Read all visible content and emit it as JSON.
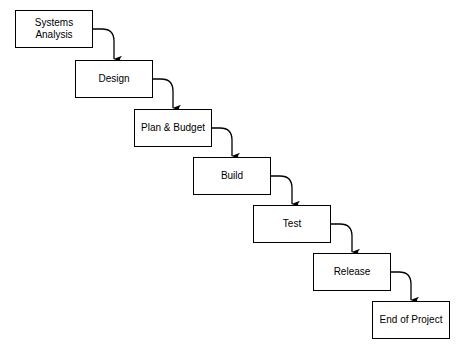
{
  "diagram": {
    "type": "flowchart",
    "background_color": "#ffffff",
    "line_color": "#000000",
    "box_fill_color": "#ffffff",
    "box_border_color": "#000000",
    "text_color": "#000000",
    "nodes": [
      {
        "id": "systems-analysis",
        "label": "Systems\nAnalysis",
        "x": 15,
        "y": 10,
        "width": 78,
        "height": 38
      },
      {
        "id": "design",
        "label": "Design",
        "x": 75,
        "y": 60,
        "width": 78,
        "height": 38
      },
      {
        "id": "plan-and-budget",
        "label": "Plan & Budget",
        "x": 134,
        "y": 109,
        "width": 78,
        "height": 38
      },
      {
        "id": "build",
        "label": "Build",
        "x": 193,
        "y": 157,
        "width": 78,
        "height": 38
      },
      {
        "id": "test",
        "label": "Test",
        "x": 253,
        "y": 205,
        "width": 78,
        "height": 38
      },
      {
        "id": "release",
        "label": "Release",
        "x": 313,
        "y": 253,
        "width": 78,
        "height": 38
      },
      {
        "id": "end-of-project",
        "label": "End of Project",
        "x": 372,
        "y": 301,
        "width": 78,
        "height": 38
      }
    ],
    "connectors": [
      {
        "id": "systems-analysis-to-design",
        "from": "systems-analysis",
        "to": "design",
        "start_x": 93,
        "start_y": 29,
        "end_x": 114,
        "end_y": 60
      },
      {
        "id": "design-to-plan-and-budget",
        "from": "design",
        "to": "plan-and-budget",
        "start_x": 153,
        "start_y": 79,
        "end_x": 173,
        "end_y": 109
      },
      {
        "id": "plan-and-budget-to-build",
        "from": "plan-and-budget",
        "to": "build",
        "start_x": 212,
        "start_y": 128,
        "end_x": 232,
        "end_y": 157
      },
      {
        "id": "build-to-test",
        "from": "build",
        "to": "test",
        "start_x": 271,
        "start_y": 176,
        "end_x": 292,
        "end_y": 205
      },
      {
        "id": "test-to-release",
        "from": "test",
        "to": "release",
        "start_x": 331,
        "start_y": 224,
        "end_x": 352,
        "end_y": 253
      },
      {
        "id": "release-to-end-of-project",
        "from": "release",
        "to": "end-of-project",
        "start_x": 391,
        "start_y": 272,
        "end_x": 411,
        "end_y": 301
      }
    ]
  }
}
